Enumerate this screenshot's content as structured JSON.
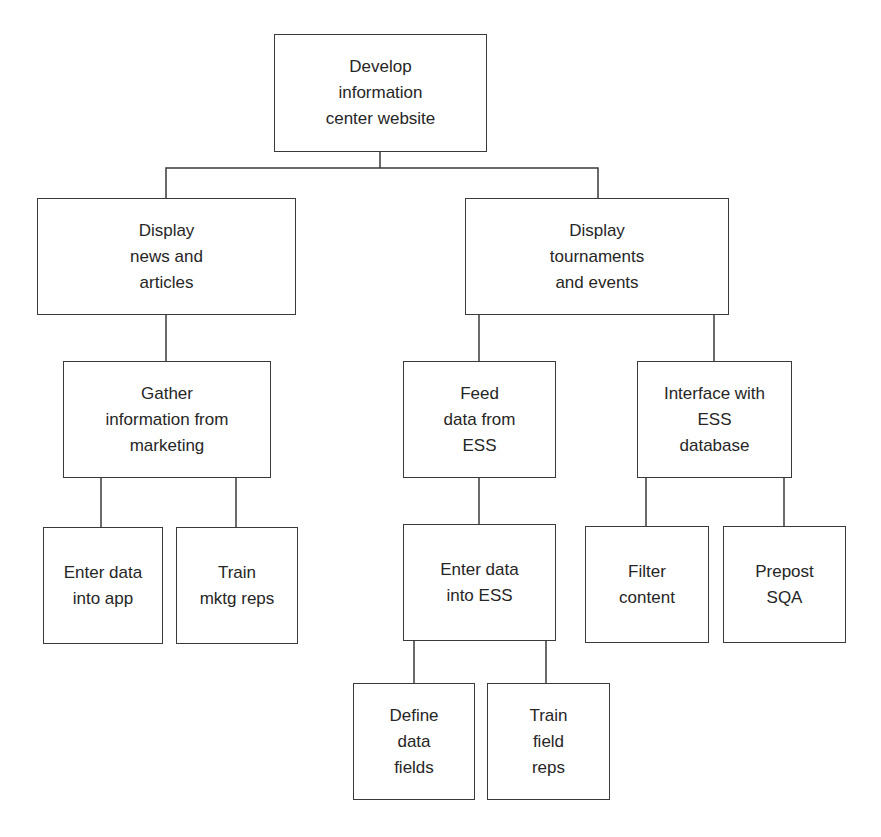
{
  "diagram": {
    "type": "work-breakdown-structure",
    "colors": {
      "line": "#3a3a3a",
      "text": "#262626",
      "background": "#ffffff"
    },
    "nodes": {
      "root": {
        "label": "Develop\ninformation\ncenter website",
        "x": 274,
        "y": 34,
        "w": 213,
        "h": 118
      },
      "news": {
        "label": "Display\nnews and\narticles",
        "x": 37,
        "y": 198,
        "w": 259,
        "h": 117
      },
      "tournaments": {
        "label": "Display\ntournaments\nand events",
        "x": 465,
        "y": 198,
        "w": 264,
        "h": 117
      },
      "gather": {
        "label": "Gather\ninformation from\nmarketing",
        "x": 63,
        "y": 361,
        "w": 208,
        "h": 117
      },
      "feed": {
        "label": "Feed\ndata from\nESS",
        "x": 403,
        "y": 361,
        "w": 153,
        "h": 117
      },
      "interface": {
        "label": "Interface with\nESS\ndatabase",
        "x": 637,
        "y": 361,
        "w": 155,
        "h": 117
      },
      "enter_app": {
        "label": "Enter data\ninto app",
        "x": 43,
        "y": 527,
        "w": 120,
        "h": 117
      },
      "train_mktg": {
        "label": "Train\nmktg reps",
        "x": 176,
        "y": 527,
        "w": 122,
        "h": 117
      },
      "enter_ess": {
        "label": "Enter data\ninto ESS",
        "x": 403,
        "y": 524,
        "w": 153,
        "h": 117
      },
      "filter": {
        "label": "Filter\ncontent",
        "x": 585,
        "y": 526,
        "w": 124,
        "h": 117
      },
      "prepost": {
        "label": "Prepost\nSQA",
        "x": 723,
        "y": 526,
        "w": 123,
        "h": 117
      },
      "define": {
        "label": "Define\ndata\nfields",
        "x": 353,
        "y": 683,
        "w": 122,
        "h": 117
      },
      "train_field": {
        "label": "Train\nfield\nreps",
        "x": 487,
        "y": 683,
        "w": 123,
        "h": 117
      }
    },
    "edges": [
      [
        "root",
        "news"
      ],
      [
        "root",
        "tournaments"
      ],
      [
        "news",
        "gather"
      ],
      [
        "tournaments",
        "feed"
      ],
      [
        "tournaments",
        "interface"
      ],
      [
        "gather",
        "enter_app"
      ],
      [
        "gather",
        "train_mktg"
      ],
      [
        "feed",
        "enter_ess"
      ],
      [
        "interface",
        "filter"
      ],
      [
        "interface",
        "prepost"
      ],
      [
        "enter_ess",
        "define"
      ],
      [
        "enter_ess",
        "train_field"
      ]
    ],
    "connector_paths": [
      "M380,152 V168",
      "M166,198 V168 H598 V198",
      "M166,315 V361",
      "M479,315 V361",
      "M714,315 V361",
      "M101,478 V527",
      "M236,478 V527",
      "M479,478 V524",
      "M646,478 V526",
      "M784,478 V526",
      "M414,641 V683",
      "M546,641 V683"
    ]
  }
}
